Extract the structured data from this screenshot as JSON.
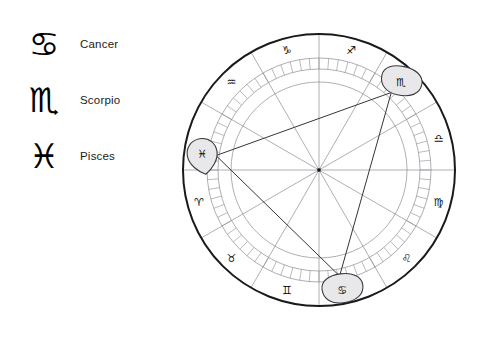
{
  "legend": {
    "items": [
      {
        "glyph": "♋",
        "icon_name": "cancer-glyph-icon",
        "label": "Cancer"
      },
      {
        "glyph": "♏",
        "icon_name": "scorpio-glyph-icon",
        "label": "Scorpio"
      },
      {
        "glyph": "♓",
        "icon_name": "pisces-glyph-icon",
        "label": "Pisces"
      }
    ]
  },
  "chart_data": {
    "type": "scatter",
    "title": "",
    "xlabel": "",
    "ylabel": "",
    "layout": {
      "center_x": 136,
      "center_y": 136,
      "outer_radius": 136,
      "sign_band_inner_radius": 112,
      "tick_ring_outer_radius": 112,
      "tick_ring_inner_radius": 101,
      "inner_circle_radius": 88,
      "grid": false,
      "legend_position": "left"
    },
    "colors": {
      "outer_rim": "#1a1a1a",
      "thin_line": "#8d8d94",
      "aspect_line": "#35353a",
      "marker_fill": "#e8e8ea",
      "marker_stroke": "#3a3a3f",
      "glyph": "#0d0d0d"
    },
    "signs": [
      {
        "name": "Capricorn",
        "glyph": "♑",
        "angle_deg": 105,
        "label_angle_deg": 105
      },
      {
        "name": "Sagittarius",
        "glyph": "♐",
        "angle_deg": 75,
        "label_angle_deg": 75
      },
      {
        "name": "Scorpio",
        "glyph": "♏",
        "angle_deg": 45,
        "label_angle_deg": 45
      },
      {
        "name": "Libra",
        "glyph": "♎",
        "angle_deg": 15,
        "label_angle_deg": 15
      },
      {
        "name": "Virgo",
        "glyph": "♍",
        "angle_deg": 345,
        "label_angle_deg": 345
      },
      {
        "name": "Leo",
        "glyph": "♌",
        "angle_deg": 315,
        "label_angle_deg": 315
      },
      {
        "name": "Cancer",
        "glyph": "♋",
        "angle_deg": 285,
        "label_angle_deg": 285
      },
      {
        "name": "Gemini",
        "glyph": "♊",
        "angle_deg": 255,
        "label_angle_deg": 255
      },
      {
        "name": "Taurus",
        "glyph": "♉",
        "angle_deg": 225,
        "label_angle_deg": 225
      },
      {
        "name": "Aries",
        "glyph": "♈",
        "angle_deg": 195,
        "label_angle_deg": 195
      },
      {
        "name": "Pisces",
        "glyph": "♓",
        "angle_deg": 165,
        "label_angle_deg": 165
      },
      {
        "name": "Aquarius",
        "glyph": "♒",
        "angle_deg": 135,
        "label_angle_deg": 135
      }
    ],
    "house_cusp_angles_deg": [
      0,
      30,
      60,
      90,
      120,
      150,
      180,
      210,
      240,
      270,
      300,
      330
    ],
    "visible_sign_glyphs": [
      "♑",
      "♐",
      "♒",
      "♎",
      "♍",
      "♌",
      "♈",
      "♉",
      "♊"
    ],
    "markers": [
      {
        "name": "Pisces",
        "glyph": "♓",
        "angle_deg": 172,
        "radius": 118,
        "shape": "teardrop",
        "rotation_deg": -10
      },
      {
        "name": "Scorpio",
        "glyph": "♏",
        "angle_deg": 47,
        "radius": 120,
        "shape": "blob",
        "rotation_deg": 12
      },
      {
        "name": "Cancer",
        "glyph": "♋",
        "angle_deg": 281,
        "radius": 122,
        "shape": "blob",
        "rotation_deg": -8
      }
    ],
    "aspect_lines": [
      {
        "from": "Pisces",
        "to": "Scorpio"
      },
      {
        "from": "Scorpio",
        "to": "Cancer"
      },
      {
        "from": "Cancer",
        "to": "Pisces"
      }
    ],
    "tick_count": 72
  }
}
